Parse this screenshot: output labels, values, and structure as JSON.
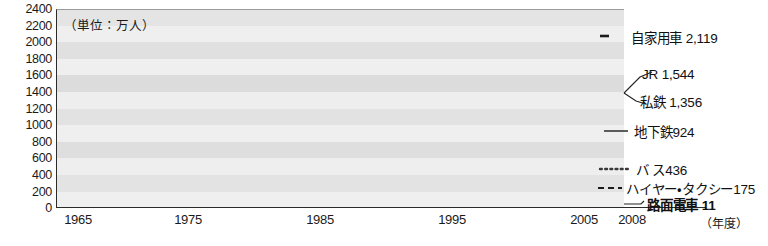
{
  "unit_caption": "（単位：万人）",
  "fiscal_caption": "（年度）",
  "axes": {
    "y_ticks": [
      "2400",
      "2200",
      "2000",
      "1800",
      "1600",
      "1400",
      "1200",
      "1000",
      "800",
      "600",
      "400",
      "200",
      "0"
    ],
    "x_ticks": [
      "1965",
      "1975",
      "1985",
      "1995",
      "2005",
      "2008"
    ]
  },
  "series_labels": [
    {
      "name": "自家用車",
      "value": "2,119",
      "text": "自家用車 2,119"
    },
    {
      "name": "JR",
      "value": "1,544",
      "text": "JR 1,544"
    },
    {
      "name": "私鉄",
      "value": "1,356",
      "text": "私鉄 1,356"
    },
    {
      "name": "地下鉄",
      "value": "924",
      "text": "地下鉄924"
    },
    {
      "name": "バス",
      "value": "436",
      "text": "バ ス436"
    },
    {
      "name": "ハイヤー・タクシー",
      "value": "175",
      "text": "ハイヤー・タクシー175"
    },
    {
      "name": "路面電車",
      "value": "11",
      "text": "路面電車 11"
    }
  ],
  "chart_data": {
    "type": "line",
    "title": "",
    "xlabel": "（年度）",
    "ylabel": "（単位：万人）",
    "xlim": [
      1965,
      2008
    ],
    "ylim": [
      0,
      2400
    ],
    "ytick_step": 200,
    "grid": "horizontal-bands",
    "legend": "right-inline-labels",
    "x": [
      1965,
      1970,
      1975,
      1980,
      1985,
      1990,
      1995,
      2000,
      2005,
      2008
    ],
    "series": [
      {
        "name": "自家用車",
        "style": "dash-dot",
        "color": "#1a1a1a",
        "end_value": 2119,
        "values": [
          180,
          430,
          700,
          1000,
          1330,
          1760,
          2180,
          2200,
          2160,
          2119
        ]
      },
      {
        "name": "JR",
        "style": "dotted-fine",
        "color": "#666666",
        "end_value": 1544,
        "values": [
          990,
          1055,
          1105,
          1160,
          1230,
          1340,
          1480,
          1500,
          1520,
          1544
        ]
      },
      {
        "name": "私鉄",
        "style": "solid-gray",
        "color": "#777777",
        "end_value": 1356,
        "values": [
          700,
          790,
          870,
          960,
          1060,
          1210,
          1400,
          1420,
          1420,
          1356
        ]
      },
      {
        "name": "地下鉄",
        "style": "solid-dark",
        "color": "#2b2b2b",
        "end_value": 924,
        "values": [
          130,
          230,
          330,
          450,
          560,
          680,
          760,
          820,
          880,
          924
        ]
      },
      {
        "name": "バス",
        "style": "dotted-bold",
        "color": "#3a3a3a",
        "end_value": 436,
        "values": [
          620,
          660,
          680,
          660,
          620,
          580,
          540,
          500,
          460,
          436
        ]
      },
      {
        "name": "ハイヤー・タクシー",
        "style": "dashed",
        "color": "#1a1a1a",
        "end_value": 175,
        "values": [
          220,
          225,
          225,
          220,
          215,
          210,
          205,
          195,
          182,
          175
        ]
      },
      {
        "name": "路面電車",
        "style": "solid-heavy",
        "color": "#111111",
        "end_value": 11,
        "values": [
          200,
          90,
          20,
          14,
          13,
          12,
          12,
          11,
          11,
          11
        ]
      }
    ]
  }
}
